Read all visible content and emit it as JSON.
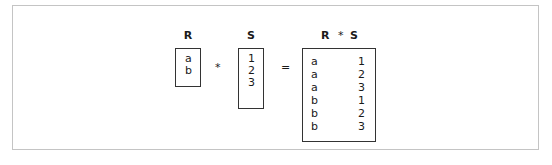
{
  "diagram": {
    "relations": {
      "R": {
        "label": "R",
        "values": [
          "a",
          "b"
        ]
      },
      "S": {
        "label": "S",
        "values": [
          "1",
          "2",
          "3"
        ]
      },
      "RS": {
        "label_left": "R",
        "label_op": "*",
        "label_right": "S",
        "rows": [
          [
            "a",
            "1"
          ],
          [
            "a",
            "2"
          ],
          [
            "a",
            "3"
          ],
          [
            "b",
            "1"
          ],
          [
            "b",
            "2"
          ],
          [
            "b",
            "3"
          ]
        ]
      }
    },
    "operators": {
      "product": "*",
      "equals": "="
    },
    "colors": {
      "frame": "#c4c4c4",
      "box": "#333333",
      "text": "#1a1a1a"
    }
  }
}
